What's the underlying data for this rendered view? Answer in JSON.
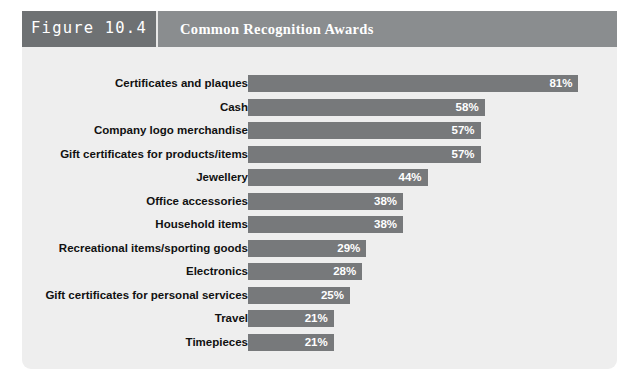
{
  "figure": {
    "number_label": "Figure 10.4",
    "title": "Common Recognition Awards"
  },
  "colors": {
    "number_band": "#6e7173",
    "title_band": "#8a8d8f",
    "bar": "#77797b",
    "card_background": "#eeeeee",
    "label_text": "#111111",
    "value_text": "#ffffff"
  },
  "chart_data": {
    "type": "bar",
    "orientation": "horizontal",
    "title": "Common Recognition Awards",
    "xlabel": "",
    "ylabel": "",
    "xlim": [
      0,
      90
    ],
    "grid": false,
    "legend": false,
    "value_suffix": "%",
    "categories": [
      "Certificates and plaques",
      "Cash",
      "Company logo merchandise",
      "Gift certificates for products/items",
      "Jewellery",
      "Office accessories",
      "Household items",
      "Recreational items/sporting goods",
      "Electronics",
      "Gift certificates for personal services",
      "Travel",
      "Timepieces"
    ],
    "values": [
      81,
      58,
      57,
      57,
      44,
      38,
      38,
      29,
      28,
      25,
      21,
      21
    ],
    "value_labels": [
      "81%",
      "58%",
      "57%",
      "57%",
      "44%",
      "38%",
      "38%",
      "29%",
      "28%",
      "25%",
      "21%",
      "21%"
    ]
  }
}
